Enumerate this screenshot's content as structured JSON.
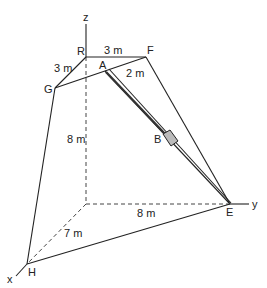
{
  "diagram": {
    "axes": {
      "x": "x",
      "y": "y",
      "z": "z"
    },
    "points": {
      "R": "R",
      "F": "F",
      "G": "G",
      "A": "A",
      "B": "B",
      "E": "E",
      "H": "H"
    },
    "dimensions": {
      "RF": "3 m",
      "RG": "3 m",
      "AF": "2 m",
      "height": "8 m",
      "OE": "8 m",
      "OH": "7 m"
    }
  }
}
